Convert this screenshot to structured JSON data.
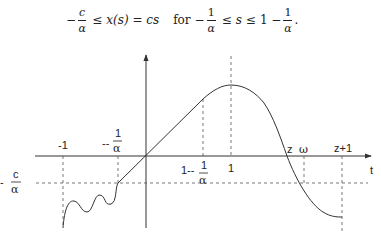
{
  "equation": {
    "lhs_minus": "−",
    "lhs_num": "c",
    "lhs_den": "α",
    "leq1": "≤",
    "expr": "x(s) = cs",
    "for_word": "for",
    "range_minus": "−",
    "range_num": "1",
    "range_den": "α",
    "leq2": "≤",
    "var": "s",
    "leq3": "≤",
    "upper_one": "1 −",
    "upper_num": "1",
    "upper_den": "α",
    "period": "."
  },
  "figure": {
    "axis_label_t": "t",
    "x_labels": {
      "minus_one": "-1",
      "minus_inv_alpha_prefix": "--",
      "minus_inv_alpha_num": "1",
      "minus_inv_alpha_den": "α",
      "one_minus_inv_alpha_prefix": "1--",
      "one_minus_inv_alpha_num": "1",
      "one_minus_inv_alpha_den": "α",
      "one": "1",
      "z": "z",
      "omega": "ω",
      "z_plus_one": "z+1"
    },
    "y_labels": {
      "minus_c_over_alpha_prefix": "-",
      "minus_c_over_alpha_num": "c",
      "minus_c_over_alpha_den": "α"
    },
    "colors": {
      "stroke": "#333333",
      "dashed": "#555555",
      "background": "#ffffff"
    }
  }
}
